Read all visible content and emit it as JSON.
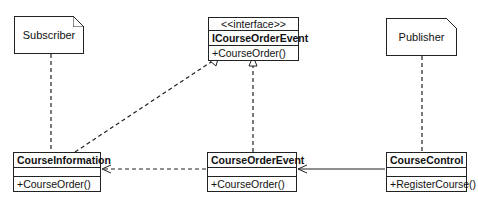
{
  "notes": {
    "subscriber": "Subscriber",
    "publisher": "Publisher"
  },
  "classes": {
    "interface": {
      "stereotype": "<<interface>>",
      "name": "ICourseOrderEvent",
      "operations": [
        "+CourseOrder()"
      ]
    },
    "course_information": {
      "name": "CourseInformation",
      "operations": [
        "+CourseOrder()"
      ]
    },
    "course_order_event": {
      "name": "CourseOrderEvent",
      "operations": [
        "+CourseOrder()"
      ]
    },
    "course_control": {
      "name": "CourseControl",
      "operations": [
        "+RegisterCourse()"
      ]
    }
  },
  "relations": [
    {
      "from": "CourseInformation",
      "to": "ICourseOrderEvent",
      "type": "realization"
    },
    {
      "from": "CourseOrderEvent",
      "to": "ICourseOrderEvent",
      "type": "realization"
    },
    {
      "from": "CourseOrderEvent",
      "to": "CourseInformation",
      "type": "dependency"
    },
    {
      "from": "CourseControl",
      "to": "CourseOrderEvent",
      "type": "association"
    },
    {
      "from": "Subscriber",
      "to": "CourseInformation",
      "type": "note-anchor"
    },
    {
      "from": "Publisher",
      "to": "CourseControl",
      "type": "note-anchor"
    }
  ]
}
